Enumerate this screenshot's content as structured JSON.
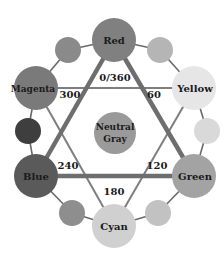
{
  "diagram": {
    "center": {
      "label_line1": "Neutral",
      "label_line2": "Gray",
      "color": "#9a9a9a"
    },
    "primary_nodes": [
      {
        "name": "Red",
        "hue": "0/360",
        "color": "#808080"
      },
      {
        "name": "Yellow",
        "hue": "60",
        "color": "#e6e6e6"
      },
      {
        "name": "Green",
        "hue": "120",
        "color": "#a3a3a3"
      },
      {
        "name": "Cyan",
        "hue": "180",
        "color": "#d0d0d0"
      },
      {
        "name": "Blue",
        "hue": "240",
        "color": "#5a5a5a"
      },
      {
        "name": "Magenta",
        "hue": "300",
        "color": "#7a7a7a"
      }
    ],
    "intermediate_nodes": [
      {
        "between": "Red-Yellow",
        "color": "#b5b5b5"
      },
      {
        "between": "Yellow-Green",
        "color": "#d9d9d9"
      },
      {
        "between": "Green-Cyan",
        "color": "#c2c2c2"
      },
      {
        "between": "Cyan-Blue",
        "color": "#8e8e8e"
      },
      {
        "between": "Blue-Magenta",
        "color": "#3e3e3e"
      },
      {
        "between": "Magenta-Red",
        "color": "#8a8a8a"
      }
    ],
    "hue_labels": [
      "0/360",
      "60",
      "120",
      "180",
      "240",
      "300"
    ],
    "line_colors": {
      "thick": "#6e6e6e",
      "thin": "#8a8a8a",
      "ring": "#6a6a6a"
    }
  }
}
